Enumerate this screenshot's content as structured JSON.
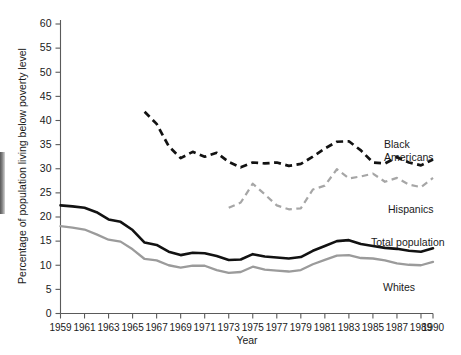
{
  "chart_data": {
    "type": "line",
    "title": "",
    "xlabel": "Year",
    "ylabel": "Percentage of population living below poverty level",
    "xlim": [
      1959,
      1990
    ],
    "ylim": [
      0,
      60
    ],
    "grid": false,
    "legend_position": "inline-right-of-series",
    "ytick_labels": [
      "0",
      "5",
      "10",
      "15",
      "20",
      "25",
      "30",
      "35",
      "40",
      "45",
      "50",
      "55",
      "60"
    ],
    "ytick_values": [
      0,
      5,
      10,
      15,
      20,
      25,
      30,
      35,
      40,
      45,
      50,
      55,
      60
    ],
    "xtick_labels": [
      "1959",
      "1961",
      "1963",
      "1965",
      "1967",
      "1969",
      "1971",
      "1973",
      "1975",
      "1977",
      "1979",
      "1981",
      "1983",
      "1985",
      "1987",
      "1989",
      "1990"
    ],
    "xtick_values": [
      1959,
      1961,
      1963,
      1965,
      1967,
      1969,
      1971,
      1973,
      1975,
      1977,
      1979,
      1981,
      1983,
      1985,
      1987,
      1989,
      1990
    ],
    "series": [
      {
        "name": "Black Americans",
        "label": "Black\nAmericans",
        "label_line1": "Black",
        "label_line2": "Americans",
        "style": "dashed",
        "color": "#121212",
        "x": [
          1966,
          1967,
          1968,
          1969,
          1970,
          1971,
          1972,
          1973,
          1974,
          1975,
          1976,
          1977,
          1978,
          1979,
          1980,
          1981,
          1982,
          1983,
          1984,
          1985,
          1986,
          1987,
          1988,
          1989,
          1990
        ],
        "values": [
          41.8,
          39.3,
          34.7,
          32.2,
          33.5,
          32.5,
          33.3,
          31.4,
          30.3,
          31.3,
          31.1,
          31.3,
          30.6,
          31.0,
          32.5,
          34.2,
          35.6,
          35.7,
          33.8,
          31.3,
          31.1,
          32.4,
          31.3,
          30.7,
          31.9
        ]
      },
      {
        "name": "Hispanics",
        "label": "Hispanics",
        "style": "dashed",
        "color": "#a6a6a6",
        "x": [
          1973,
          1974,
          1975,
          1976,
          1977,
          1978,
          1979,
          1980,
          1981,
          1982,
          1983,
          1984,
          1985,
          1986,
          1987,
          1988,
          1989,
          1990
        ],
        "values": [
          21.9,
          23.0,
          26.9,
          24.7,
          22.4,
          21.6,
          21.8,
          25.7,
          26.5,
          29.9,
          28.0,
          28.4,
          29.0,
          27.3,
          28.1,
          26.7,
          26.2,
          28.1
        ]
      },
      {
        "name": "Total population",
        "label": "Total population",
        "style": "solid",
        "color": "#121212",
        "x": [
          1959,
          1960,
          1961,
          1962,
          1963,
          1964,
          1965,
          1966,
          1967,
          1968,
          1969,
          1970,
          1971,
          1972,
          1973,
          1974,
          1975,
          1976,
          1977,
          1978,
          1979,
          1980,
          1981,
          1982,
          1983,
          1984,
          1985,
          1986,
          1987,
          1988,
          1989,
          1990
        ],
        "values": [
          22.4,
          22.2,
          21.9,
          21.0,
          19.5,
          19.0,
          17.3,
          14.7,
          14.2,
          12.8,
          12.1,
          12.6,
          12.5,
          11.9,
          11.1,
          11.2,
          12.3,
          11.8,
          11.6,
          11.4,
          11.7,
          13.0,
          14.0,
          15.0,
          15.2,
          14.4,
          14.0,
          13.6,
          13.4,
          13.0,
          12.8,
          13.5
        ]
      },
      {
        "name": "Whites",
        "label": "Whites",
        "style": "solid",
        "color": "#9b9b9b",
        "x": [
          1959,
          1960,
          1961,
          1962,
          1963,
          1964,
          1965,
          1966,
          1967,
          1968,
          1969,
          1970,
          1971,
          1972,
          1973,
          1974,
          1975,
          1976,
          1977,
          1978,
          1979,
          1980,
          1981,
          1982,
          1983,
          1984,
          1985,
          1986,
          1987,
          1988,
          1989,
          1990
        ],
        "values": [
          18.1,
          17.8,
          17.4,
          16.4,
          15.3,
          14.9,
          13.3,
          11.3,
          11.0,
          10.0,
          9.5,
          9.9,
          9.9,
          9.0,
          8.4,
          8.6,
          9.7,
          9.1,
          8.9,
          8.7,
          9.0,
          10.2,
          11.1,
          12.0,
          12.1,
          11.5,
          11.4,
          11.0,
          10.4,
          10.1,
          10.0,
          10.7
        ]
      }
    ]
  },
  "annotations": {
    "black_label_line1": "Black",
    "black_label_line2": "Americans",
    "hispanics_label": "Hispanics",
    "total_label": "Total population",
    "whites_label": "Whites"
  }
}
